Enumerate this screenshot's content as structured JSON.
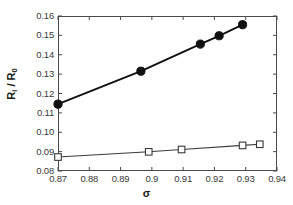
{
  "chart_data": {
    "type": "line",
    "title": "",
    "xlabel": "σ",
    "ylabel": "R i / R 0",
    "ylabel_base": "R",
    "ylabel_sub_numerator": "i",
    "ylabel_separator": " / ",
    "ylabel_base2": "R",
    "ylabel_sub_denominator": "0",
    "xlim": [
      0.87,
      0.94
    ],
    "ylim": [
      0.08,
      0.16
    ],
    "xticks": [
      0.87,
      0.88,
      0.89,
      0.9,
      0.91,
      0.92,
      0.93,
      0.94
    ],
    "yticks": [
      0.08,
      0.09,
      0.1,
      0.11,
      0.12,
      0.13,
      0.14,
      0.15,
      0.16
    ],
    "xtick_labels": [
      "0.87",
      "0.88",
      "0.89",
      "0.9",
      "0.91",
      "0.92",
      "0.93",
      "0.94"
    ],
    "ytick_labels": [
      "0.08",
      "0.09",
      "0.10",
      "0.11",
      "0.12",
      "0.13",
      "0.14",
      "0.15",
      "0.16"
    ],
    "grid": false,
    "legend": "none",
    "series": [
      {
        "name": "filled-circle-series",
        "marker": "filled-circle",
        "color": "#111111",
        "x": [
          0.87,
          0.8965,
          0.9155,
          0.9215,
          0.929
        ],
        "y": [
          0.1145,
          0.1315,
          0.1455,
          0.1498,
          0.1555
        ]
      },
      {
        "name": "open-square-series",
        "marker": "open-square",
        "color": "#3a3a3a",
        "x": [
          0.87,
          0.899,
          0.9095,
          0.929,
          0.9345
        ],
        "y": [
          0.0872,
          0.0899,
          0.0911,
          0.0932,
          0.0938
        ]
      }
    ]
  }
}
